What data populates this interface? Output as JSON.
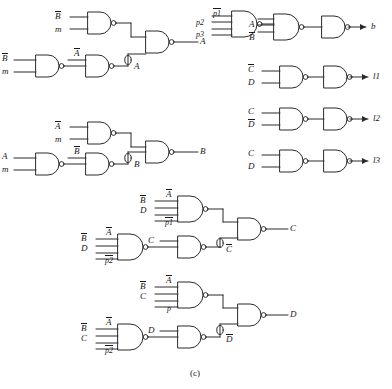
{
  "figure": {
    "caption": "(c)",
    "type": "logic-gate-circuit-diagram"
  },
  "blocks": {
    "A": {
      "output_label": "A",
      "feedback_label": "A",
      "upper_gate_inputs": [
        "B",
        "m"
      ],
      "lower_gate_inputs": [
        "B",
        "m"
      ],
      "mid_gate_input": "A"
    },
    "B": {
      "output_label": "B",
      "feedback_label": "B",
      "upper_gate_inputs": [
        "A",
        "m"
      ],
      "lower_gate_inputs": [
        "A",
        "m"
      ],
      "mid_gate_input": "B"
    },
    "C": {
      "output_label": "C",
      "feedback_label": "C",
      "upper_gate_inputs": [
        "B",
        "D",
        "A",
        "p1"
      ],
      "lower_gate_inputs": [
        "B",
        "D",
        "A",
        "p2"
      ],
      "mid_gate_input": "C"
    },
    "D": {
      "output_label": "D",
      "feedback_label": "D",
      "upper_gate_inputs": [
        "B",
        "C",
        "A",
        "p"
      ],
      "lower_gate_inputs": [
        "B",
        "C",
        "A",
        "p2"
      ],
      "mid_gate_input": "D"
    }
  },
  "right_column": {
    "b_row": {
      "first_gate_inputs": [
        "p2",
        "p1",
        "p3"
      ],
      "second_gate_inputs": [
        "A",
        "B"
      ],
      "output": "b"
    },
    "l1_row": {
      "gate_inputs": [
        "C",
        "D"
      ],
      "output": "l1"
    },
    "l2_row": {
      "gate_inputs": [
        "C",
        "D"
      ],
      "output": "l2"
    },
    "l3_row": {
      "gate_inputs": [
        "C",
        "D"
      ],
      "output": "l3"
    }
  },
  "labels": {
    "A_plain": "A",
    "B_plain": "B",
    "C_plain": "C",
    "D_plain": "D",
    "m": "m",
    "p": "p",
    "p1": "p1",
    "p2": "p2",
    "p3": "p3",
    "out_b": "b",
    "out_l1": "l1",
    "out_l2": "l2",
    "out_l3": "l3"
  },
  "colors": {
    "stroke": "#2b2b2b",
    "text": "#181818",
    "background": "#ffffff"
  }
}
